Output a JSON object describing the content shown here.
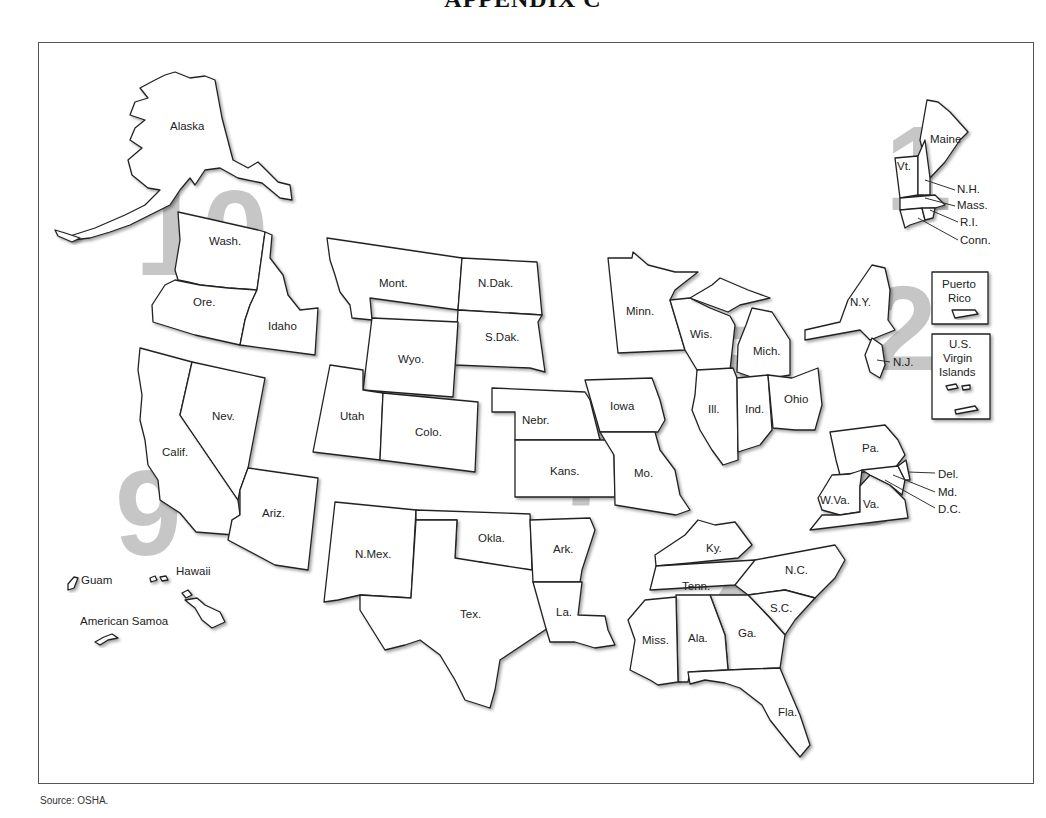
{
  "document": {
    "title": "APPENDIX C",
    "source": "Source: OSHA."
  },
  "map": {
    "region_number_color": "#b9b9b9",
    "regions": [
      {
        "number": "1",
        "states": [
          "Maine",
          "Vt.",
          "N.H.",
          "Mass.",
          "R.I.",
          "Conn."
        ]
      },
      {
        "number": "2",
        "states": [
          "N.Y.",
          "N.J.",
          "Puerto Rico",
          "U.S. Virgin Islands"
        ]
      },
      {
        "number": "3",
        "states": [
          "Pa.",
          "Del.",
          "Md.",
          "D.C.",
          "W.Va.",
          "Va."
        ]
      },
      {
        "number": "4",
        "states": [
          "Ky.",
          "Tenn.",
          "N.C.",
          "S.C.",
          "Ga.",
          "Ala.",
          "Miss.",
          "Fla."
        ]
      },
      {
        "number": "5",
        "states": [
          "Minn.",
          "Wis.",
          "Mich.",
          "Ill.",
          "Ind.",
          "Ohio"
        ]
      },
      {
        "number": "6",
        "states": [
          "N.Mex.",
          "Okla.",
          "Ark.",
          "Tex.",
          "La."
        ]
      },
      {
        "number": "7",
        "states": [
          "Nebr.",
          "Iowa",
          "Kans.",
          "Mo."
        ]
      },
      {
        "number": "8",
        "states": [
          "Mont.",
          "N.Dak.",
          "S.Dak.",
          "Wyo.",
          "Utah",
          "Colo."
        ]
      },
      {
        "number": "9",
        "states": [
          "Calif.",
          "Nev.",
          "Ariz.",
          "Hawaii",
          "Guam",
          "American Samoa"
        ]
      },
      {
        "number": "10",
        "states": [
          "Alaska",
          "Wash.",
          "Ore.",
          "Idaho"
        ]
      }
    ],
    "labels": {
      "alaska": "Alaska",
      "wash": "Wash.",
      "ore": "Ore.",
      "idaho": "Idaho",
      "calif": "Calif.",
      "nev": "Nev.",
      "ariz": "Ariz.",
      "mont": "Mont.",
      "ndak": "N.Dak.",
      "sdak": "S.Dak.",
      "wyo": "Wyo.",
      "utah": "Utah",
      "colo": "Colo.",
      "nebr": "Nebr.",
      "iowa": "Iowa",
      "kans": "Kans.",
      "mo": "Mo.",
      "nmex": "N.Mex.",
      "okla": "Okla.",
      "ark": "Ark.",
      "tex": "Tex.",
      "la": "La.",
      "minn": "Minn.",
      "wis": "Wis.",
      "mich": "Mich.",
      "ill": "Ill.",
      "ind": "Ind.",
      "ohio": "Ohio",
      "ky": "Ky.",
      "tenn": "Tenn.",
      "nc": "N.C.",
      "sc": "S.C.",
      "ga": "Ga.",
      "ala": "Ala.",
      "miss": "Miss.",
      "fla": "Fla.",
      "pa": "Pa.",
      "wva": "W.Va.",
      "va": "Va.",
      "del": "Del.",
      "md": "Md.",
      "dc": "D.C.",
      "ny": "N.Y.",
      "nj": "N.J.",
      "pr_line1": "Puerto",
      "pr_line2": "Rico",
      "vi_line1": "U.S.",
      "vi_line2": "Virgin",
      "vi_line3": "Islands",
      "maine": "Maine",
      "vt": "Vt.",
      "nh": "N.H.",
      "mass": "Mass.",
      "ri": "R.I.",
      "conn": "Conn.",
      "guam": "Guam",
      "hawaii": "Hawaii",
      "samoa": "American Samoa"
    },
    "region_numbers": {
      "r1": "1",
      "r2": "2",
      "r3": "3",
      "r4": "4",
      "r5": "5",
      "r6": "6",
      "r7": "7",
      "r8": "8",
      "r9": "9",
      "r10": "10"
    }
  }
}
